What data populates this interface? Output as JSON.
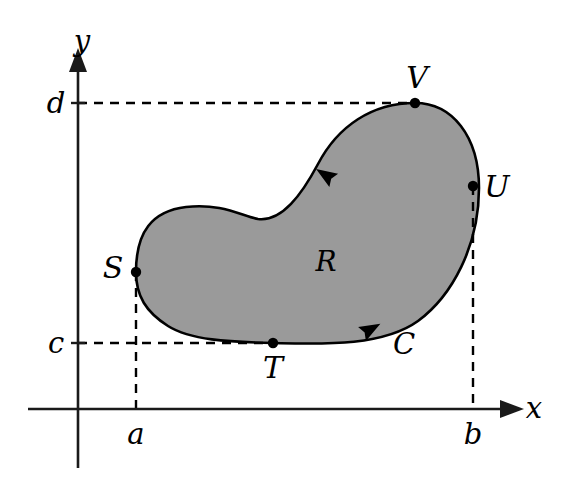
{
  "figure": {
    "background_color": "#ffffff",
    "region_fill_color": "#9a9a9a",
    "curve_color": "#000000",
    "axis_color": "#1a1a1a",
    "dashed_color": "#000000"
  },
  "axes": {
    "x_label": "x",
    "y_label": "y",
    "origin_px": {
      "x": 78,
      "y": 409
    },
    "x_axis_from_px": 28,
    "x_axis_to_px": 510,
    "y_axis_from_px": 468,
    "y_axis_to_px": 62
  },
  "ticks": {
    "x": [
      {
        "label": "a",
        "value_px": 136
      },
      {
        "label": "b",
        "value_px": 473
      }
    ],
    "y": [
      {
        "label": "c",
        "value_px": 343
      },
      {
        "label": "d",
        "value_px": 103
      }
    ]
  },
  "points": [
    {
      "id": "S",
      "label": "S",
      "px": {
        "x": 136,
        "y": 272
      },
      "label_px": {
        "x": 113,
        "y": 268
      },
      "role": "leftmost-point-x-equals-a"
    },
    {
      "id": "T",
      "label": "T",
      "px": {
        "x": 273,
        "y": 343
      },
      "label_px": {
        "x": 273,
        "y": 368
      },
      "role": "lowest-point-y-equals-c"
    },
    {
      "id": "U",
      "label": "U",
      "px": {
        "x": 473,
        "y": 186
      },
      "label_px": {
        "x": 497,
        "y": 187
      },
      "role": "rightmost-point-x-equals-b"
    },
    {
      "id": "V",
      "label": "V",
      "px": {
        "x": 415,
        "y": 103
      },
      "label_px": {
        "x": 417,
        "y": 78
      },
      "role": "highest-point-y-equals-d"
    }
  ],
  "region": {
    "label": "R",
    "label_px": {
      "x": 326,
      "y": 262
    }
  },
  "curve": {
    "label": "C",
    "label_px": {
      "x": 404,
      "y": 344
    },
    "orientation": "counterclockwise",
    "arrow_markers": [
      {
        "px": {
          "x": 327,
          "y": 176
        },
        "angle_deg": 213,
        "on": "upper-boundary"
      },
      {
        "px": {
          "x": 369,
          "y": 330
        },
        "angle_deg": 331,
        "on": "lower-boundary"
      }
    ],
    "path_d": "M 136 272 C 136 232 152 211 186 207 C 222 203 242 216 258 219 C 282 222 302 194 318 164 C 338 126 372 103 415 103 C 452 103 479 136 479 188 C 479 246 452 296 418 321 C 382 347 320 344 273 343 C 228 342 190 340 168 326 C 146 312 136 296 136 272 Z"
  },
  "dashed_lines": [
    {
      "name": "d-horizontal",
      "from_px": {
        "x": 78,
        "y": 103
      },
      "to_px": {
        "x": 415,
        "y": 103
      }
    },
    {
      "name": "c-horizontal",
      "from_px": {
        "x": 78,
        "y": 343
      },
      "to_px": {
        "x": 273,
        "y": 343
      }
    },
    {
      "name": "a-vertical",
      "from_px": {
        "x": 136,
        "y": 272
      },
      "to_px": {
        "x": 136,
        "y": 409
      }
    },
    {
      "name": "b-vertical",
      "from_px": {
        "x": 473,
        "y": 186
      },
      "to_px": {
        "x": 473,
        "y": 409
      }
    }
  ]
}
